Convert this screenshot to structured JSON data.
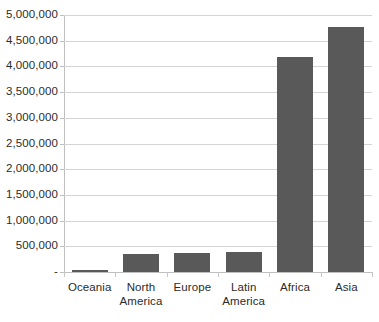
{
  "chart_data": {
    "type": "bar",
    "title": "",
    "subtitle": "",
    "xlabel": "",
    "ylabel": "",
    "categories": [
      "Oceania",
      "North America",
      "Europe",
      "Latin America",
      "Africa",
      "Asia"
    ],
    "category_lines": [
      [
        "Oceania"
      ],
      [
        "North",
        "America"
      ],
      [
        "Europe"
      ],
      [
        "Latin",
        "America"
      ],
      [
        "Africa"
      ],
      [
        "Asia"
      ]
    ],
    "values": [
      40000,
      350000,
      375000,
      380000,
      4180000,
      4770000
    ],
    "ylim": [
      0,
      5000000
    ],
    "y_ticks": [
      0,
      500000,
      1000000,
      1500000,
      2000000,
      2500000,
      3000000,
      3500000,
      4000000,
      4500000,
      5000000
    ],
    "y_tick_labels": [
      "-",
      "500,000",
      "1,000,000",
      "1,500,000",
      "2,000,000",
      "2,500,000",
      "3,000,000",
      "3,500,000",
      "4,000,000",
      "4,500,000",
      "5,000,000"
    ],
    "grid": true,
    "legend": false,
    "legend_position": "none",
    "series": [
      {
        "name": "",
        "values": [
          40000,
          350000,
          375000,
          380000,
          4180000,
          4770000
        ]
      }
    ],
    "colors": {
      "bar_fill": "#595959",
      "gridline": "#d4d4d4",
      "axis_line": "#bfbfbf",
      "tick_mark": "#c6c6c6",
      "text": "#2b2b2b",
      "background": "#ffffff"
    }
  }
}
